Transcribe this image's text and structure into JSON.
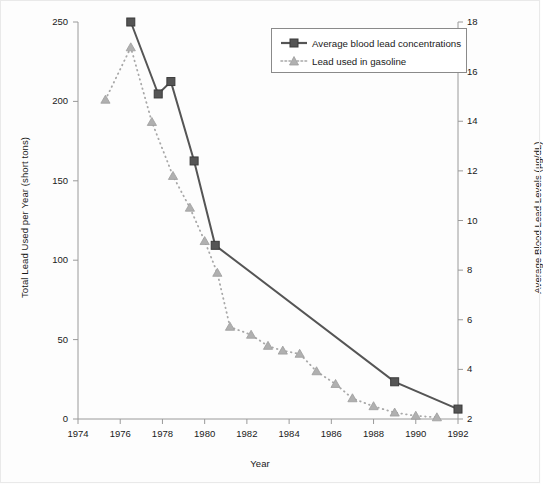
{
  "chart_data": {
    "type": "line",
    "title": "",
    "xlabel": "Year",
    "ylabel": "Total Lead Used per Year (short tons)",
    "ylabel_right": "Average Blood Lead Levels (µg/dL)",
    "xlim": [
      1974,
      1992
    ],
    "ylim": [
      0,
      250
    ],
    "ylim_right": [
      2,
      18
    ],
    "grid": false,
    "legend_position": "upper right",
    "xticks": [
      1974,
      1976,
      1978,
      1980,
      1982,
      1984,
      1986,
      1988,
      1990,
      1992
    ],
    "yticks_left": [
      0,
      50,
      100,
      150,
      200,
      250
    ],
    "yticks_right": [
      2,
      4,
      6,
      8,
      10,
      12,
      14,
      16,
      18
    ],
    "series": [
      {
        "name": "Average blood lead concentrations",
        "axis": "right",
        "marker": "square",
        "linestyle": "solid",
        "color": "#555555",
        "x": [
          1976.5,
          1977.8,
          1978.4,
          1979.5,
          1980.5,
          1989.0,
          1992.0
        ],
        "values": [
          18.0,
          15.1,
          15.6,
          12.4,
          9.0,
          3.5,
          2.4
        ]
      },
      {
        "name": "Lead used in gasoline",
        "axis": "left",
        "marker": "triangle",
        "linestyle": "dotted",
        "color": "#a8a8a8",
        "x": [
          1975.3,
          1976.5,
          1977.5,
          1978.5,
          1979.3,
          1980.0,
          1980.6,
          1981.2,
          1982.2,
          1983.0,
          1983.7,
          1984.5,
          1985.3,
          1986.2,
          1987.0,
          1988.0,
          1989.0,
          1990.0,
          1991.0
        ],
        "values": [
          201,
          234,
          187,
          153,
          133,
          112,
          92,
          58,
          53,
          46,
          43,
          41,
          30,
          22,
          13,
          8,
          4,
          2,
          1
        ]
      }
    ]
  },
  "legend": {
    "items": [
      {
        "label": "Average blood lead concentrations",
        "marker": "square",
        "style": "solid",
        "color": "#555555"
      },
      {
        "label": "Lead used in gasoline",
        "marker": "triangle",
        "style": "dotted",
        "color": "#a8a8a8"
      }
    ]
  },
  "axes": {
    "left_title": "Total Lead Used per Year (short tons)",
    "right_title": "Average Blood Lead Levels (µg/dL)",
    "x_title": "Year",
    "left_ticks": [
      "0",
      "50",
      "100",
      "150",
      "200",
      "250"
    ],
    "right_ticks": [
      "2",
      "4",
      "6",
      "8",
      "10",
      "12",
      "14",
      "16",
      "18"
    ],
    "x_ticks": [
      "1974",
      "1976",
      "1978",
      "1980",
      "1982",
      "1984",
      "1986",
      "1988",
      "1990",
      "1992"
    ]
  },
  "caption": {
    "fragment": ""
  }
}
